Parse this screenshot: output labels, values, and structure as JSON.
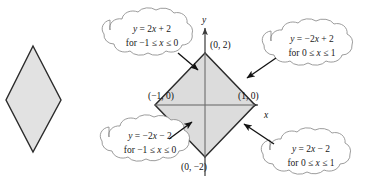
{
  "figure": {
    "colors": {
      "shape_fill": "#e2e2e2",
      "shape_stroke": "#2b2b2b",
      "axis": "#3a3a3a",
      "callout_stroke": "#8a8a8a",
      "callout_fill": "#ffffff",
      "arrow": "#111111",
      "text": "#111111",
      "background": "#ffffff"
    }
  },
  "left_shape": {
    "name": "rhombus",
    "vertices": [
      [
        33,
        46
      ],
      [
        61,
        100
      ],
      [
        33,
        152
      ],
      [
        6,
        100
      ]
    ]
  },
  "graph": {
    "origin": [
      205,
      105
    ],
    "unit_x": 50,
    "unit_y": 26,
    "axes": {
      "x_label": "x",
      "y_label": "y",
      "x_start": [
        155,
        105
      ],
      "x_end": [
        262,
        105
      ],
      "y_start": [
        205,
        176
      ],
      "y_end": [
        205,
        24
      ]
    },
    "diamond_vertices": [
      [
        205,
        53
      ],
      [
        255,
        105
      ],
      [
        205,
        157
      ],
      [
        155,
        105
      ]
    ],
    "point_labels": [
      {
        "id": "top-vertex-label",
        "text": "(0, 2)",
        "x": 210,
        "y": 48
      },
      {
        "id": "right-vertex-label",
        "text": "(1, 0)",
        "x": 240,
        "y": 99
      },
      {
        "id": "left-vertex-label",
        "text": "(−1, 0)",
        "x": 150,
        "y": 99
      },
      {
        "id": "bottom-vertex-label",
        "text": "(0, −2)",
        "x": 183,
        "y": 168
      }
    ]
  },
  "callouts": [
    {
      "id": "callout-top-left",
      "equation_parts": [
        {
          "text": "y",
          "style": "italic"
        },
        {
          "text": " = 2",
          "style": "roman"
        },
        {
          "text": "x",
          "style": "italic"
        },
        {
          "text": " + 2",
          "style": "roman"
        }
      ],
      "equation": "y = 2x + 2",
      "domain_parts": [
        {
          "text": "for −1 ≤ ",
          "style": "roman"
        },
        {
          "text": "x",
          "style": "italic"
        },
        {
          "text": " ≤ 0",
          "style": "roman"
        }
      ],
      "domain": "for −1 ≤ x ≤ 0",
      "center": [
        152,
        35
      ],
      "rx": 48,
      "ry": 24,
      "arrow": {
        "from": [
          178,
          53
        ],
        "to": [
          199,
          71
        ]
      }
    },
    {
      "id": "callout-top-right",
      "equation_parts": [
        {
          "text": "y",
          "style": "italic"
        },
        {
          "text": " = −2",
          "style": "roman"
        },
        {
          "text": "x",
          "style": "italic"
        },
        {
          "text": " + 2",
          "style": "roman"
        }
      ],
      "equation": "y = −2x + 2",
      "domain_parts": [
        {
          "text": "for 0 ≤ ",
          "style": "roman"
        },
        {
          "text": "x",
          "style": "italic"
        },
        {
          "text": " ≤ 1",
          "style": "roman"
        }
      ],
      "domain": "for 0 ≤ x ≤ 1",
      "center": [
        312,
        45
      ],
      "rx": 48,
      "ry": 23,
      "arrow": {
        "from": [
          275,
          59
        ],
        "to": [
          246,
          79
        ]
      }
    },
    {
      "id": "callout-bottom-left",
      "equation_parts": [
        {
          "text": "y",
          "style": "italic"
        },
        {
          "text": " = −2",
          "style": "roman"
        },
        {
          "text": "x",
          "style": "italic"
        },
        {
          "text": " − 2",
          "style": "roman"
        }
      ],
      "equation": "y = −2x − 2",
      "domain_parts": [
        {
          "text": "for −1 ≤ ",
          "style": "roman"
        },
        {
          "text": "x",
          "style": "italic"
        },
        {
          "text": " ≤ 0",
          "style": "roman"
        }
      ],
      "domain": "for −1 ≤ x ≤ 0",
      "center": [
        150,
        142
      ],
      "rx": 47,
      "ry": 23,
      "arrow": {
        "from": [
          170,
          138
        ],
        "to": [
          192,
          122
        ]
      }
    },
    {
      "id": "callout-bottom-right",
      "equation_parts": [
        {
          "text": "y",
          "style": "italic"
        },
        {
          "text": " = 2",
          "style": "roman"
        },
        {
          "text": "x",
          "style": "italic"
        },
        {
          "text": " − 2",
          "style": "roman"
        }
      ],
      "equation": "y = 2x − 2",
      "domain_parts": [
        {
          "text": "for 0 ≤ ",
          "style": "roman"
        },
        {
          "text": "x",
          "style": "italic"
        },
        {
          "text": " ≤ 1",
          "style": "roman"
        }
      ],
      "domain": "for 0 ≤ x ≤ 1",
      "center": [
        311,
        155
      ],
      "rx": 47,
      "ry": 23,
      "arrow": {
        "from": [
          273,
          143
        ],
        "to": [
          243,
          124
        ]
      }
    }
  ]
}
